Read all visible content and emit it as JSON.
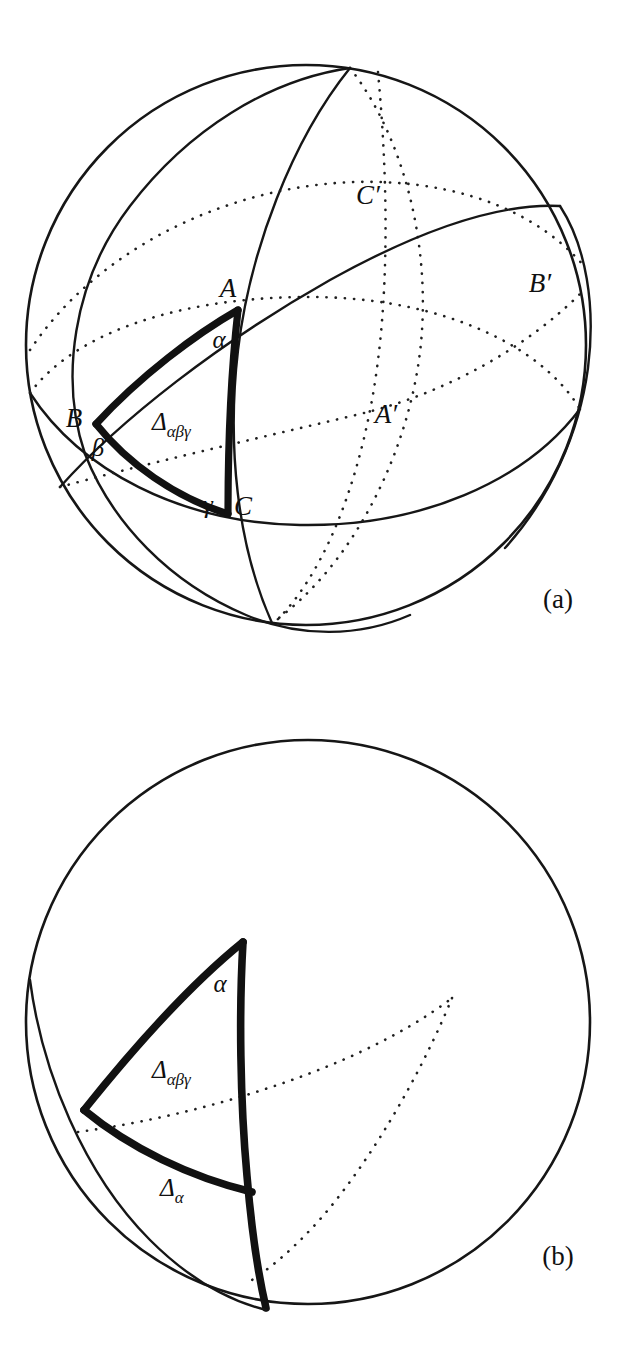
{
  "figure": {
    "kind": "mathematical-diagram",
    "background_color": "#ffffff",
    "ink_color": "#111111",
    "width": 619,
    "height": 1355
  },
  "panels": [
    {
      "id": "a",
      "caption": "(a)",
      "caption_pos": {
        "x": 558,
        "y": 608
      },
      "sphere": {
        "cx": 306,
        "cy": 345,
        "r": 280
      },
      "description": "Sphere with three great circles forming spherical triangle ABC and antipodal points A', B', C'",
      "labels": [
        {
          "name": "vertex-A",
          "text": "A",
          "x": 228,
          "y": 297,
          "style": "italic"
        },
        {
          "name": "vertex-B",
          "text": "B",
          "x": 74,
          "y": 427,
          "style": "italic"
        },
        {
          "name": "vertex-C",
          "text": "C",
          "x": 236,
          "y": 515,
          "style": "italic"
        },
        {
          "name": "angle-alpha",
          "text": "α",
          "x": 214,
          "y": 345,
          "style": "italic"
        },
        {
          "name": "angle-beta",
          "text": "β",
          "x": 90,
          "y": 452,
          "style": "italic"
        },
        {
          "name": "angle-gamma",
          "text": "γ",
          "x": 199,
          "y": 513,
          "style": "italic"
        },
        {
          "name": "antipode-A-prime",
          "text": "A′",
          "x": 372,
          "y": 423,
          "style": "italic"
        },
        {
          "name": "antipode-B-prime",
          "text": "B′",
          "x": 524,
          "y": 292,
          "style": "italic"
        },
        {
          "name": "antipode-C-prime",
          "text": "C′",
          "x": 354,
          "y": 204,
          "style": "italic"
        }
      ],
      "region_label": {
        "name": "region-delta-alpha-beta-gamma",
        "base": "Δ",
        "subscript": "αβγ",
        "x": 152,
        "y": 430
      }
    },
    {
      "id": "b",
      "caption": "(b)",
      "caption_pos": {
        "x": 558,
        "y": 1265
      },
      "sphere": {
        "cx": 308,
        "cy": 1022,
        "r": 282
      },
      "description": "Sphere with the spherical triangle and the adjacent lune region",
      "labels": [
        {
          "name": "angle-alpha",
          "text": "α",
          "x": 213,
          "y": 992,
          "style": "italic"
        }
      ],
      "region_labels": [
        {
          "name": "region-delta-alpha-beta-gamma",
          "base": "Δ",
          "subscript": "αβγ",
          "x": 152,
          "y": 1078
        },
        {
          "name": "region-delta-alpha",
          "base": "Δ",
          "subscript": "α",
          "x": 160,
          "y": 1196
        }
      ]
    }
  ],
  "glyphs": {
    "delta": "Δ",
    "alpha": "α",
    "beta": "β",
    "gamma": "γ",
    "prime": "′",
    "alpha_beta_gamma": "αβγ"
  }
}
